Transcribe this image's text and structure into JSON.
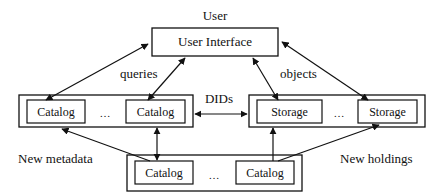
{
  "diagram": {
    "user_label": "User",
    "user_interface": {
      "label": "User Interface"
    },
    "edge_labels": {
      "queries": "queries",
      "objects": "objects",
      "dids": "DIDs",
      "new_metadata": "New metadata",
      "new_holdings": "New holdings"
    },
    "catalog_group": {
      "items": [
        "Catalog",
        "Catalog"
      ],
      "ellipsis": "…"
    },
    "storage_group": {
      "items": [
        "Storage",
        "Storage"
      ],
      "ellipsis": "…"
    },
    "source_group": {
      "items": [
        "Catalog",
        "Catalog"
      ],
      "ellipsis": "…"
    },
    "colors": {
      "line": "#111111",
      "background": "#ffffff"
    }
  }
}
